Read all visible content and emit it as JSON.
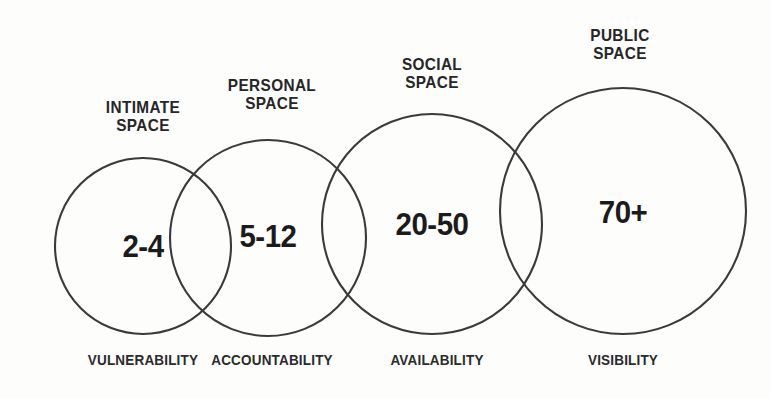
{
  "diagram": {
    "kind": "proxemics-venn",
    "background_color": "#fdfdfc",
    "stroke_color": "#3a3a3a",
    "text_color": "#262626",
    "zones": [
      {
        "id": "intimate",
        "title": "INTIMATE\nSPACE",
        "count": "2-4",
        "attribute": "VULNERABILITY",
        "cx": 143,
        "cy": 246,
        "r": 88,
        "title_cx": 143,
        "title_top": 98,
        "count_cy": 250,
        "attr_cx": 143,
        "attr_top": 352
      },
      {
        "id": "personal",
        "title": "PERSONAL\nSPACE",
        "count": "5-12",
        "attribute": "ACCOUNTABILITY",
        "cx": 268,
        "cy": 238,
        "r": 98,
        "title_cx": 272,
        "title_top": 76,
        "count_cy": 240,
        "attr_cx": 272,
        "attr_top": 352
      },
      {
        "id": "social",
        "title": "SOCIAL\nSPACE",
        "count": "20-50",
        "attribute": "AVAILABILITY",
        "cx": 432,
        "cy": 224,
        "r": 110,
        "title_cx": 432,
        "title_top": 55,
        "count_cy": 228,
        "attr_cx": 437,
        "attr_top": 352
      },
      {
        "id": "public",
        "title": "PUBLIC\nSPACE",
        "count": "70+",
        "attribute": "VISIBILITY",
        "cx": 623,
        "cy": 211,
        "r": 123,
        "title_cx": 620,
        "title_top": 26,
        "count_cy": 216,
        "attr_cx": 623,
        "attr_top": 352
      }
    ]
  }
}
